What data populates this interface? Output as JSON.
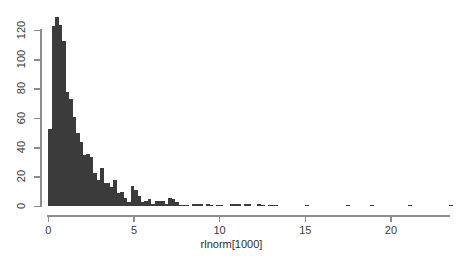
{
  "chart_data": {
    "type": "bar",
    "title": "",
    "subtitle": "",
    "xlabel": "rlnorm[1000]",
    "ylabel": "",
    "legend": [],
    "grid": false,
    "xlim": [
      0,
      23.6
    ],
    "ylim": [
      0,
      132
    ],
    "xticks": [
      0,
      5,
      10,
      15,
      20
    ],
    "xtick_labels": [
      "0",
      "5",
      "10",
      "15",
      "20"
    ],
    "yticks": [
      0,
      20,
      40,
      60,
      80,
      100,
      120
    ],
    "ytick_labels": [
      "0",
      "20",
      "40",
      "60",
      "80",
      "100",
      "120"
    ],
    "bin_width": 0.2,
    "bin_starts": [
      0.0,
      0.2,
      0.4,
      0.6,
      0.8,
      1.0,
      1.2,
      1.4,
      1.6,
      1.8,
      2.0,
      2.2,
      2.4,
      2.6,
      2.8,
      3.0,
      3.2,
      3.4,
      3.6,
      3.8,
      4.0,
      4.2,
      4.4,
      4.6,
      4.8,
      5.0,
      5.2,
      5.4,
      5.6,
      5.8,
      6.0,
      6.2,
      6.4,
      6.6,
      6.8,
      7.0,
      7.2,
      7.4,
      7.6,
      7.8,
      8.0,
      8.2,
      8.4,
      8.6,
      8.8,
      9.0,
      9.2,
      9.4,
      9.6,
      9.8,
      10.0,
      10.2,
      10.4,
      10.6,
      10.8,
      11.0,
      11.2,
      11.4,
      11.6,
      11.8,
      12.0,
      12.2,
      12.4,
      12.6,
      12.8,
      13.0,
      13.2,
      13.4,
      13.6,
      13.8,
      14.0,
      14.2,
      14.4,
      14.6,
      14.8,
      15.0,
      15.2,
      15.4,
      15.6,
      15.8,
      16.0,
      16.2,
      16.4,
      16.6,
      16.8,
      17.0,
      17.2,
      17.4,
      17.6,
      17.8,
      18.0,
      18.2,
      18.4,
      18.6,
      18.8,
      19.0,
      19.2,
      19.4,
      19.6,
      19.8,
      20.0,
      20.2,
      20.4,
      20.6,
      20.8,
      21.0,
      21.2,
      21.4,
      21.6,
      21.8,
      22.0,
      22.2,
      22.4,
      22.6,
      22.8,
      23.0,
      23.2,
      23.4
    ],
    "values": [
      53,
      123,
      129,
      124,
      113,
      78,
      73,
      61,
      50,
      44,
      35,
      36,
      34,
      23,
      18,
      26,
      16,
      16,
      13,
      18,
      9,
      10,
      6,
      3,
      14,
      11,
      7,
      3,
      4,
      5,
      2,
      4,
      4,
      4,
      2,
      6,
      5,
      3,
      1,
      1,
      1,
      0,
      2,
      2,
      2,
      0,
      2,
      1,
      0,
      1,
      1,
      0,
      0,
      2,
      2,
      2,
      0,
      2,
      2,
      0,
      0,
      2,
      1,
      0,
      1,
      1,
      1,
      0,
      0,
      0,
      0,
      0,
      0,
      0,
      0,
      1,
      0,
      0,
      0,
      0,
      0,
      0,
      0,
      0,
      0,
      0,
      0,
      1,
      0,
      0,
      0,
      0,
      0,
      0,
      1,
      0,
      0,
      0,
      0,
      0,
      0,
      0,
      0,
      0,
      0,
      1,
      0,
      0,
      0,
      0,
      0,
      0,
      0,
      0,
      0,
      0,
      0,
      1
    ]
  },
  "axes": {
    "x_axis_name": "x-axis",
    "y_axis_name": "y-axis"
  }
}
